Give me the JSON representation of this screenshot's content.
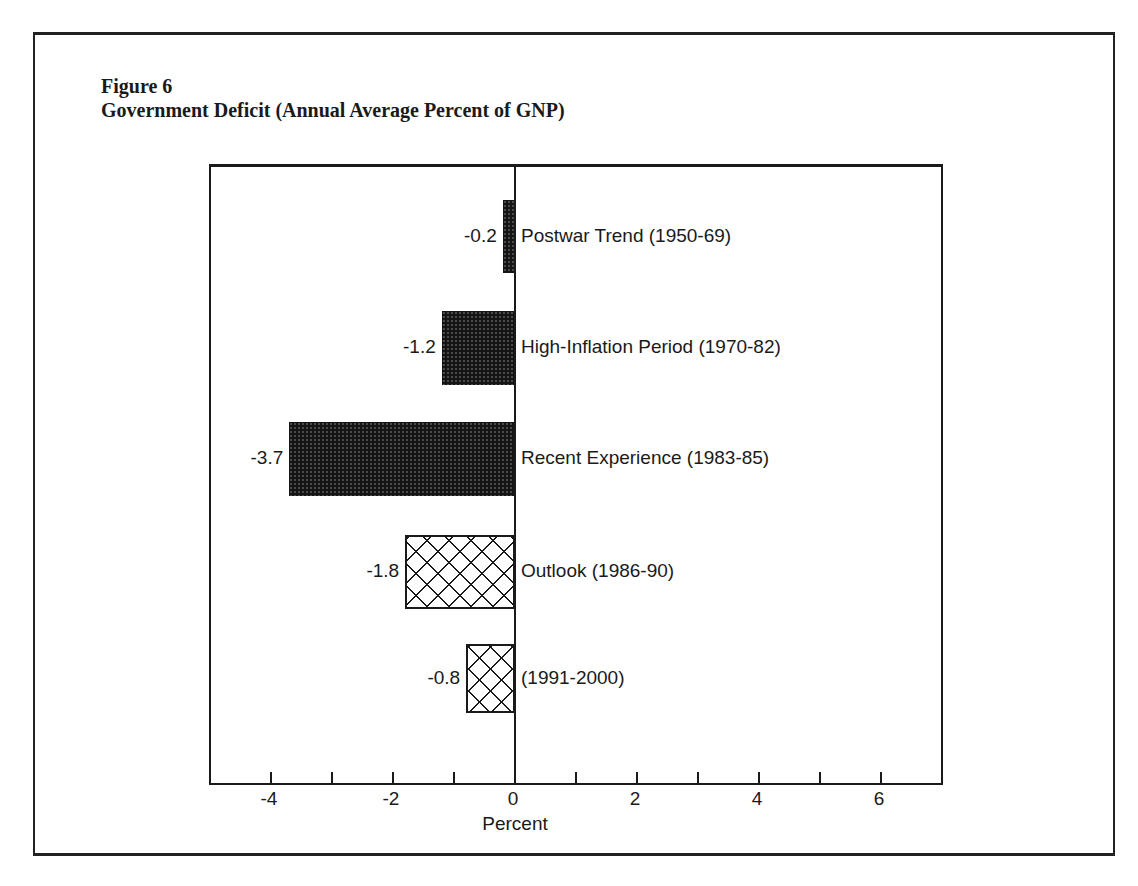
{
  "figure": {
    "label": "Figure 6",
    "title": "Government Deficit (Annual Average Percent of GNP)"
  },
  "chart_data": {
    "type": "bar",
    "orientation": "horizontal",
    "title": "Government Deficit (Annual Average Percent of GNP)",
    "figure_label": "Figure 6",
    "xlabel": "Percent",
    "ylabel": "",
    "xlim": [
      -5,
      7
    ],
    "x_ticks": [
      -4,
      -2,
      0,
      2,
      4,
      6
    ],
    "x_minor_ticks": [
      -4,
      -3,
      -2,
      -1,
      0,
      1,
      2,
      3,
      4,
      5,
      6
    ],
    "grid": false,
    "legend": null,
    "categories": [
      "Postwar Trend (1950-69)",
      "High-Inflation Period (1970-82)",
      "Recent Experience (1983-85)",
      "Outlook (1986-90)",
      "(1991-2000)"
    ],
    "values": [
      -0.2,
      -1.2,
      -3.7,
      -1.8,
      -0.8
    ],
    "value_labels": [
      "-0.2",
      "-1.2",
      "-3.7",
      "-1.8",
      "-0.8"
    ],
    "fill_styles": [
      "solid-stipple",
      "solid-stipple",
      "solid-stipple",
      "crosshatch",
      "crosshatch"
    ],
    "annotations": "Actual periods shown as dark stippled bars; outlook/projection periods shown as crosshatched bars"
  },
  "axis": {
    "title": "Percent",
    "tick_labels": [
      "-4",
      "-2",
      "0",
      "2",
      "4",
      "6"
    ]
  }
}
